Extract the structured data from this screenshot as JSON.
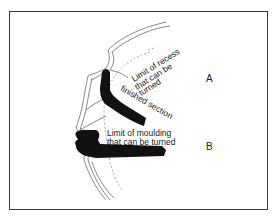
{
  "diagram": {
    "labels": {
      "recess_line1": "Limit of recess",
      "recess_line2": "that can be",
      "recess_line3": "turned",
      "finished_section": "finished section",
      "moulding_line1": "Limit of moulding",
      "moulding_line2": "that can be turned",
      "marker_a": "A",
      "marker_b": "B"
    },
    "colors": {
      "ink": "#1a1a1a",
      "line": "#555555",
      "background": "#ffffff"
    }
  }
}
